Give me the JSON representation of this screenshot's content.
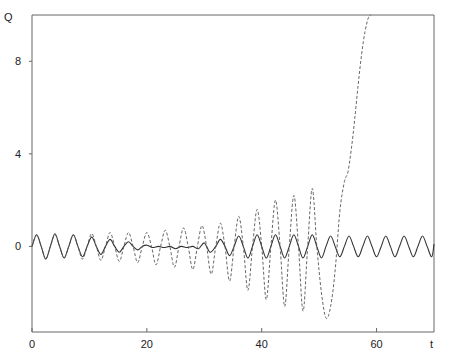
{
  "chart_data": {
    "type": "line",
    "title": "",
    "xlabel": "t",
    "ylabel": "Q",
    "xlim": [
      0,
      70
    ],
    "ylim": [
      -3.7,
      10
    ],
    "x_ticks": [
      0,
      20,
      40,
      60
    ],
    "y_ticks": [
      0,
      4,
      8
    ],
    "grid": false,
    "legend": null,
    "series": [
      {
        "name": "solid",
        "style": "solid",
        "color": "#333333",
        "x": [
          0,
          0.8,
          1.6,
          2.4,
          3.2,
          4.0,
          4.8,
          5.6,
          6.4,
          7.2,
          8.0,
          8.8,
          9.6,
          10.4,
          11.2,
          12.0,
          12.8,
          13.6,
          14.4,
          15.2,
          16.0,
          16.8,
          17.6,
          18.4,
          19.2,
          20,
          21,
          22,
          23,
          24,
          25,
          26,
          27,
          28,
          29,
          30,
          31,
          32,
          32.8,
          33.6,
          34.4,
          35.2,
          36.0,
          36.8,
          37.6,
          38.4,
          39.2,
          40.0,
          40.8,
          41.6,
          42.4,
          43.2,
          44.0,
          44.8,
          45.6,
          46.4,
          47.2,
          48.0,
          48.8,
          49.6,
          50.4,
          51.2,
          52.0,
          52.8,
          53.6,
          54.4,
          55.2,
          56.0,
          56.8,
          57.6,
          58.4,
          59.2,
          60.0,
          60.8,
          61.6,
          62.4,
          63.2,
          64.0,
          64.8,
          65.6,
          66.4,
          67.2,
          68.0,
          68.8,
          69.6,
          70
        ],
        "y": [
          0.0,
          0.5,
          0.0,
          -0.55,
          0.0,
          0.55,
          0.0,
          -0.5,
          0.0,
          0.5,
          0.0,
          -0.45,
          0.0,
          0.4,
          0.0,
          -0.35,
          0.0,
          0.3,
          0.0,
          -0.25,
          0.0,
          0.2,
          0.0,
          -0.15,
          0.0,
          0.05,
          -0.05,
          0.0,
          -0.05,
          0.0,
          -0.1,
          0.0,
          -0.05,
          0.0,
          -0.1,
          0.15,
          -0.25,
          0.0,
          0.3,
          0.0,
          -0.4,
          0.0,
          0.45,
          0.0,
          -0.5,
          0.0,
          0.5,
          0.0,
          -0.5,
          0.0,
          0.5,
          0.0,
          -0.5,
          0.0,
          0.5,
          0.0,
          -0.5,
          0.0,
          0.5,
          0.0,
          -0.5,
          0.0,
          0.45,
          0.0,
          -0.45,
          0.0,
          0.45,
          0.0,
          -0.45,
          0.0,
          0.45,
          0.0,
          -0.45,
          0.0,
          0.45,
          0.0,
          -0.45,
          0.0,
          0.45,
          0.0,
          -0.45,
          0.0,
          0.45,
          0.0,
          -0.45,
          0.1
        ]
      },
      {
        "name": "dashed",
        "style": "dashed",
        "color": "#555555",
        "x": [
          0,
          0.8,
          1.6,
          2.4,
          3.2,
          4.0,
          4.8,
          5.6,
          6.4,
          7.2,
          8.0,
          8.8,
          9.6,
          10.4,
          11.2,
          12.0,
          12.8,
          13.6,
          14.4,
          15.2,
          16.0,
          16.8,
          17.6,
          18.4,
          19.2,
          20.0,
          20.8,
          21.6,
          22.4,
          23.2,
          24.0,
          24.8,
          25.6,
          26.4,
          27.2,
          28.0,
          28.8,
          29.6,
          30.4,
          31.2,
          32.0,
          32.8,
          33.6,
          34.4,
          35.2,
          36.0,
          36.8,
          37.6,
          38.4,
          39.2,
          40.0,
          40.8,
          41.6,
          42.4,
          43.2,
          44.0,
          44.8,
          45.6,
          46.4,
          47.2,
          48.0,
          48.8,
          49.6,
          50.4,
          51.2,
          52.0,
          52.8,
          53.6,
          54.4,
          55.0,
          55.6,
          56.2,
          56.8,
          57.4,
          58.0,
          58.6,
          59.0
        ],
        "y": [
          0.0,
          0.5,
          0.0,
          -0.55,
          0.0,
          0.5,
          0.0,
          -0.5,
          0.0,
          0.5,
          0.0,
          -0.55,
          0.0,
          0.55,
          0.0,
          -0.6,
          0.0,
          0.6,
          0.0,
          -0.65,
          0.0,
          0.6,
          0.0,
          -0.7,
          0.0,
          0.6,
          0.0,
          -0.8,
          0.0,
          0.7,
          0.0,
          -0.9,
          0.0,
          0.8,
          0.0,
          -1.0,
          0.0,
          0.9,
          0.0,
          -1.2,
          0.0,
          1.0,
          0.0,
          -1.5,
          0.0,
          1.3,
          0.0,
          -1.9,
          0.0,
          1.6,
          0.0,
          -2.3,
          0.0,
          2.0,
          0.0,
          -2.6,
          0.0,
          2.2,
          0.0,
          -2.8,
          0.0,
          2.5,
          0.0,
          -2.0,
          -3.1,
          -2.6,
          -1.0,
          1.5,
          2.8,
          3.2,
          4.2,
          5.5,
          7.0,
          8.3,
          9.3,
          9.9,
          10.0
        ]
      }
    ]
  }
}
